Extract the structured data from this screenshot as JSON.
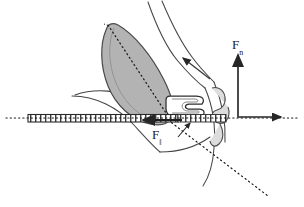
{
  "figure": {
    "background_color": "#ffffff",
    "ink_color": "#1a1a1a",
    "muscle_fill": "#b3b3b3",
    "muscle_stroke": "#4d4d4d",
    "cuticle_fill": "#d9d9d9",
    "width": 304,
    "height": 207
  },
  "labels": {
    "normal_force": {
      "symbol": "F",
      "subscript": "n",
      "name": "perpendicular force component"
    },
    "parallel_force": {
      "symbol": "F",
      "subscript": "‖",
      "name": "parallel force component"
    }
  },
  "vectors": [
    {
      "name": "normal-force-vector",
      "label": "F n",
      "orientation": "vertical",
      "direction": "up",
      "x": 238,
      "y_start": 118,
      "y_end": 56
    },
    {
      "name": "parallel-force-vector",
      "label": "F ‖",
      "orientation": "horizontal",
      "direction": "left",
      "y": 120,
      "x_start": 180,
      "x_end": 144
    },
    {
      "name": "muscle-force-vector",
      "label": "",
      "orientation": "diagonal",
      "direction": "up-left",
      "x_start": 208,
      "y_start": 78,
      "x_end": 182,
      "y_end": 58
    },
    {
      "name": "resultant-axis-arrow",
      "label": "",
      "orientation": "horizontal",
      "direction": "right",
      "y": 117,
      "x_start": 238,
      "x_end": 284
    }
  ],
  "guides": [
    {
      "name": "horizontal-axis-dotted",
      "style": "dotted",
      "orientation": "horizontal"
    },
    {
      "name": "muscle-long-axis-dotted",
      "style": "dotted",
      "orientation": "diagonal"
    },
    {
      "name": "lower-diagonal-dotted",
      "style": "dotted",
      "orientation": "diagonal"
    }
  ],
  "shapes": [
    {
      "name": "muscle-body",
      "fill": "#b3b3b3",
      "description": "shaded elongated teardrop muscle"
    },
    {
      "name": "lever-arm-bar",
      "fill": "#ffffff",
      "description": "long hatched horizontal bar"
    },
    {
      "name": "joint-condyle",
      "fill": "#f2f2f2",
      "description": "hooked articulation at center"
    },
    {
      "name": "mandible-outline",
      "fill": "none",
      "description": "curved cuticle outlines"
    }
  ]
}
